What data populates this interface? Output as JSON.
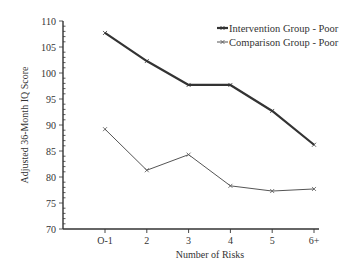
{
  "chart_data": {
    "type": "line",
    "title": "",
    "xlabel": "Number of Risks",
    "ylabel": "Adjusted 36-Month IQ Score",
    "categories": [
      "O-1",
      "2",
      "3",
      "4",
      "5",
      "6+"
    ],
    "ylim": [
      70,
      110
    ],
    "yticks": [
      70,
      75,
      80,
      85,
      90,
      95,
      100,
      105,
      110
    ],
    "grid": false,
    "legend_position": "top-right",
    "series": [
      {
        "name": "Intervention Group - Poor",
        "values": [
          107.7,
          102.3,
          97.7,
          97.7,
          92.7,
          86.2
        ],
        "color": "#333333",
        "stroke_width": 2.2
      },
      {
        "name": "Comparison Group - Poor",
        "values": [
          89.2,
          81.3,
          84.3,
          78.3,
          77.3,
          77.7
        ],
        "color": "#555555",
        "stroke_width": 1
      }
    ]
  }
}
